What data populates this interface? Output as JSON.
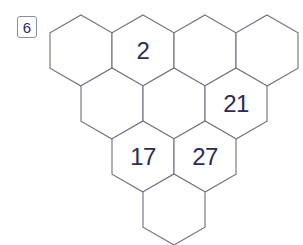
{
  "badge": {
    "label": "6",
    "border_color": "#8d8da0",
    "text_color": "#2d2d5a"
  },
  "colors": {
    "background": "#ffffff",
    "hex_stroke": "#6e6e86",
    "hex_fill": "#ffffff",
    "number_text": "#2b2b55"
  },
  "grid": {
    "orientation": "pointy-top",
    "hex_width": 62,
    "hex_height": 71,
    "origin_x": 50,
    "origin_y": 15,
    "row_x_step": 62,
    "row_y_step": 53,
    "row_indent": 31,
    "rows": [
      {
        "row_index": 0,
        "cells": [
          {
            "col": 0,
            "value": ""
          },
          {
            "col": 1,
            "value": "2"
          },
          {
            "col": 2,
            "value": ""
          },
          {
            "col": 3,
            "value": ""
          }
        ]
      },
      {
        "row_index": 1,
        "cells": [
          {
            "col": 0,
            "value": ""
          },
          {
            "col": 1,
            "value": ""
          },
          {
            "col": 2,
            "value": "21"
          }
        ]
      },
      {
        "row_index": 2,
        "cells": [
          {
            "col": 0,
            "value": "17"
          },
          {
            "col": 1,
            "value": "27"
          }
        ]
      },
      {
        "row_index": 3,
        "cells": [
          {
            "col": 0,
            "value": ""
          }
        ]
      }
    ]
  }
}
